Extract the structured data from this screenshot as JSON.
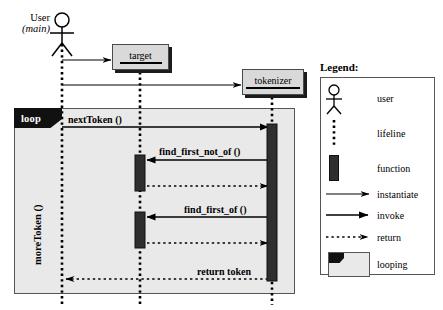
{
  "diagram": {
    "kind": "uml-sequence-diagram",
    "participants": [
      {
        "id": "user",
        "name": "User",
        "qualifier": "(main)",
        "type": "actor"
      },
      {
        "id": "target",
        "name": "target",
        "type": "object"
      },
      {
        "id": "tokenizer",
        "name": "tokenizer",
        "type": "object"
      }
    ],
    "frame": {
      "operator": "loop",
      "guard": "moreToken ()"
    },
    "messages": [
      {
        "label": "",
        "kind": "instantiate",
        "from": "user",
        "to": "target"
      },
      {
        "label": "",
        "kind": "instantiate",
        "from": "user",
        "to": "tokenizer"
      },
      {
        "label": "nextToken ()",
        "kind": "invoke",
        "from": "user",
        "to": "tokenizer"
      },
      {
        "label": "find_first_not_of ()",
        "kind": "invoke",
        "from": "tokenizer",
        "to": "target"
      },
      {
        "label": "",
        "kind": "return",
        "from": "target",
        "to": "tokenizer"
      },
      {
        "label": "find_first_of ()",
        "kind": "invoke",
        "from": "tokenizer",
        "to": "target"
      },
      {
        "label": "",
        "kind": "return",
        "from": "target",
        "to": "tokenizer"
      },
      {
        "label": "return token",
        "kind": "return",
        "from": "tokenizer",
        "to": "user"
      }
    ]
  },
  "legend": {
    "title": "Legend:",
    "items": [
      {
        "icon": "actor-icon",
        "label": "user"
      },
      {
        "icon": "lifeline-icon",
        "label": "lifeline"
      },
      {
        "icon": "function-bar-icon",
        "label": "function"
      },
      {
        "icon": "instantiate-arrow-icon",
        "label": "instantiate"
      },
      {
        "icon": "invoke-arrow-icon",
        "label": "invoke"
      },
      {
        "icon": "return-arrow-icon",
        "label": "return"
      },
      {
        "icon": "looping-frame-icon",
        "label": "looping"
      }
    ]
  },
  "colors": {
    "background": "#ffffff",
    "frame_fill": "#e9e9e9",
    "frame_stroke": "#555555",
    "object_fill": "#d9d9d9",
    "object_stroke": "#4a4a4a",
    "shadow": "#1c1c1c",
    "activation_bar": "#2e2e2e",
    "tag_fill": "#111111",
    "tag_text": "#ffffff",
    "line": "#000000"
  }
}
